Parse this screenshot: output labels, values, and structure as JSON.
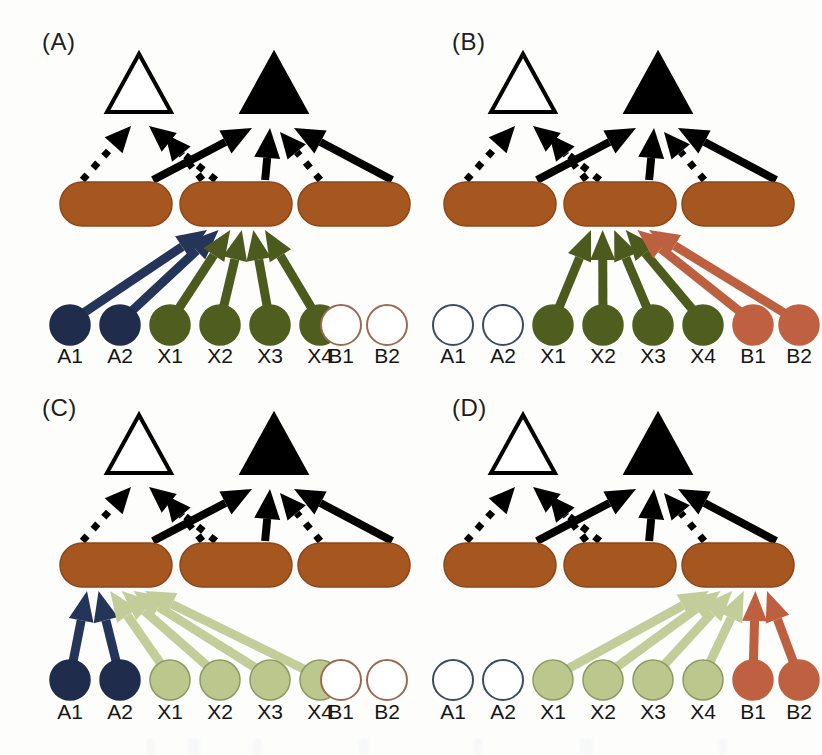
{
  "figure": {
    "width": 817,
    "height": 755,
    "background": "#fdfdfc"
  },
  "palette": {
    "brown_pill": "#a6561f",
    "brown_pill_edge": "#8d4718",
    "navy_node": "#1f2c4c",
    "navy_node_edge": "#16203a",
    "navy_arrow": "#243559",
    "olive_node": "#4f5d1e",
    "olive_arrow": "#4c5a1d",
    "terracotta_node": "#bf6140",
    "terracotta_arrow": "#bd6040",
    "pale_green_node": "#bcc78d",
    "pale_green_edge": "#8f9a62",
    "pale_green_arrow": "#c3cd99",
    "empty_circle_edge_a": "#3d4a63",
    "empty_circle_edge_b": "#9c6a52",
    "black": "#000000",
    "white": "#ffffff",
    "label_text": "#151515"
  },
  "legend_shapes": {
    "white_triangle": "inhibited-or-inactive-outcome",
    "black_triangle": "active-outcome",
    "rounded_rect": "intermediate-module",
    "filled_circle": "active-input-node",
    "open_circle": "inactive-input-node",
    "solid_arrow": "activating-edge",
    "dotted_arrow": "repressing-edge"
  },
  "node_labels": [
    "A1",
    "A2",
    "X1",
    "X2",
    "X3",
    "X4",
    "B1",
    "B2"
  ],
  "panels": [
    {
      "id": "A",
      "label": "(A)",
      "active_target_pill_index": 1,
      "nodes": [
        {
          "label": "A1",
          "state": "filled",
          "color": "#1f2c4c",
          "arrow_color": "#243559",
          "has_arrow": true
        },
        {
          "label": "A2",
          "state": "filled",
          "color": "#1f2c4c",
          "arrow_color": "#243559",
          "has_arrow": true
        },
        {
          "label": "X1",
          "state": "filled",
          "color": "#4f5d1e",
          "arrow_color": "#4c5a1d",
          "has_arrow": true
        },
        {
          "label": "X2",
          "state": "filled",
          "color": "#4f5d1e",
          "arrow_color": "#4c5a1d",
          "has_arrow": true
        },
        {
          "label": "X3",
          "state": "filled",
          "color": "#4f5d1e",
          "arrow_color": "#4c5a1d",
          "has_arrow": true
        },
        {
          "label": "X4",
          "state": "filled",
          "color": "#4f5d1e",
          "arrow_color": "#4c5a1d",
          "has_arrow": true
        },
        {
          "label": "B1",
          "state": "open",
          "color": "#ffffff",
          "arrow_color": "#9c6a52",
          "has_arrow": false
        },
        {
          "label": "B2",
          "state": "open",
          "color": "#ffffff",
          "arrow_color": "#9c6a52",
          "has_arrow": false
        }
      ]
    },
    {
      "id": "B",
      "label": "(B)",
      "active_target_pill_index": 1,
      "nodes": [
        {
          "label": "A1",
          "state": "open",
          "color": "#ffffff",
          "arrow_color": "#3d4a63",
          "has_arrow": false
        },
        {
          "label": "A2",
          "state": "open",
          "color": "#ffffff",
          "arrow_color": "#3d4a63",
          "has_arrow": false
        },
        {
          "label": "X1",
          "state": "filled",
          "color": "#4f5d1e",
          "arrow_color": "#4c5a1d",
          "has_arrow": true
        },
        {
          "label": "X2",
          "state": "filled",
          "color": "#4f5d1e",
          "arrow_color": "#4c5a1d",
          "has_arrow": true
        },
        {
          "label": "X3",
          "state": "filled",
          "color": "#4f5d1e",
          "arrow_color": "#4c5a1d",
          "has_arrow": true
        },
        {
          "label": "X4",
          "state": "filled",
          "color": "#4f5d1e",
          "arrow_color": "#4c5a1d",
          "has_arrow": true
        },
        {
          "label": "B1",
          "state": "filled",
          "color": "#bf6140",
          "arrow_color": "#bd6040",
          "has_arrow": true
        },
        {
          "label": "B2",
          "state": "filled",
          "color": "#bf6140",
          "arrow_color": "#bd6040",
          "has_arrow": true
        }
      ]
    },
    {
      "id": "C",
      "label": "(C)",
      "active_target_pill_index": 0,
      "nodes": [
        {
          "label": "A1",
          "state": "filled",
          "color": "#1f2c4c",
          "arrow_color": "#243559",
          "has_arrow": true
        },
        {
          "label": "A2",
          "state": "filled",
          "color": "#1f2c4c",
          "arrow_color": "#243559",
          "has_arrow": true
        },
        {
          "label": "X1",
          "state": "filled",
          "color": "#bcc78d",
          "arrow_color": "#c3cd99",
          "has_arrow": true
        },
        {
          "label": "X2",
          "state": "filled",
          "color": "#bcc78d",
          "arrow_color": "#c3cd99",
          "has_arrow": true
        },
        {
          "label": "X3",
          "state": "filled",
          "color": "#bcc78d",
          "arrow_color": "#c3cd99",
          "has_arrow": true
        },
        {
          "label": "X4",
          "state": "filled",
          "color": "#bcc78d",
          "arrow_color": "#c3cd99",
          "has_arrow": true
        },
        {
          "label": "B1",
          "state": "open",
          "color": "#ffffff",
          "arrow_color": "#9c6a52",
          "has_arrow": false
        },
        {
          "label": "B2",
          "state": "open",
          "color": "#ffffff",
          "arrow_color": "#9c6a52",
          "has_arrow": false
        }
      ]
    },
    {
      "id": "D",
      "label": "(D)",
      "active_target_pill_index": 2,
      "nodes": [
        {
          "label": "A1",
          "state": "open",
          "color": "#ffffff",
          "arrow_color": "#3d4a63",
          "has_arrow": false
        },
        {
          "label": "A2",
          "state": "open",
          "color": "#ffffff",
          "arrow_color": "#3d4a63",
          "has_arrow": false
        },
        {
          "label": "X1",
          "state": "filled",
          "color": "#bcc78d",
          "arrow_color": "#c3cd99",
          "has_arrow": true
        },
        {
          "label": "X2",
          "state": "filled",
          "color": "#bcc78d",
          "arrow_color": "#c3cd99",
          "has_arrow": true
        },
        {
          "label": "X3",
          "state": "filled",
          "color": "#bcc78d",
          "arrow_color": "#c3cd99",
          "has_arrow": true
        },
        {
          "label": "X4",
          "state": "filled",
          "color": "#bcc78d",
          "arrow_color": "#c3cd99",
          "has_arrow": true
        },
        {
          "label": "B1",
          "state": "filled",
          "color": "#bf6140",
          "arrow_color": "#bd6040",
          "has_arrow": true
        },
        {
          "label": "B2",
          "state": "filled",
          "color": "#bf6140",
          "arrow_color": "#bd6040",
          "has_arrow": true
        }
      ]
    }
  ],
  "upper_edges": {
    "to_white_triangle": [
      {
        "from_pill": 0,
        "style": "dotted"
      },
      {
        "from_pill": 1,
        "style": "dotted"
      }
    ],
    "to_black_triangle": [
      {
        "from_pill": 0,
        "style": "solid"
      },
      {
        "from_pill": 1,
        "style": "solid"
      },
      {
        "from_pill": 2,
        "style": "solid"
      },
      {
        "from_pill": 2,
        "style": "dotted"
      }
    ]
  }
}
